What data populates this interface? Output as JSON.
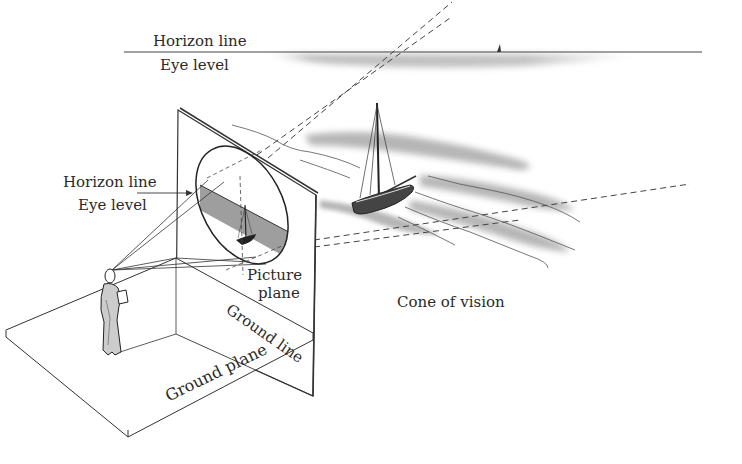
{
  "figure": {
    "type": "perspective-diagram",
    "labels": {
      "horizon_top": "Horizon line",
      "eye_level_top": "Eye level",
      "horizon_left": "Horizon line",
      "eye_level_left": "Eye level",
      "picture_plane_1": "Picture",
      "picture_plane_2": "plane",
      "ground_line": "Ground line",
      "ground_plane": "Ground plane",
      "cone_of_vision": "Cone of vision"
    },
    "colors": {
      "ink": "#2a2a2a",
      "wash": "#8a8a8a",
      "background": "#ffffff"
    }
  }
}
